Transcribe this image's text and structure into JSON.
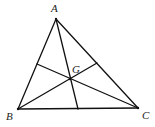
{
  "diagram": {
    "stroke_color": "#111111",
    "label_color": "#222222",
    "vertices": {
      "A": {
        "label": "A",
        "x": 56,
        "y": 19,
        "label_x": 51,
        "label_y": 12
      },
      "B": {
        "label": "B",
        "x": 18,
        "y": 109,
        "label_x": 6,
        "label_y": 120
      },
      "C": {
        "label": "C",
        "x": 138,
        "y": 108,
        "label_x": 142,
        "label_y": 119
      }
    },
    "centroid": {
      "label": "G",
      "x": 70,
      "y": 79,
      "label_x": 72,
      "label_y": 73
    },
    "midpoints": {
      "AB": {
        "x": 37,
        "y": 64
      },
      "AC": {
        "x": 97,
        "y": 63
      },
      "BC": {
        "x": 78,
        "y": 109
      }
    },
    "segments": [
      {
        "name": "side-AB",
        "from": "A",
        "to": "B"
      },
      {
        "name": "side-BC",
        "from": "B",
        "to": "C"
      },
      {
        "name": "side-CA",
        "from": "C",
        "to": "A"
      },
      {
        "name": "median-A",
        "from": "A",
        "to": "mid-BC"
      },
      {
        "name": "median-B",
        "from": "B",
        "to": "mid-AC"
      },
      {
        "name": "median-C",
        "from": "C",
        "to": "mid-AB"
      }
    ]
  }
}
